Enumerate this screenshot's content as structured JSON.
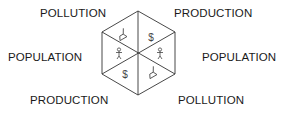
{
  "diagram": {
    "type": "hexagon-cycle",
    "labels": {
      "top_left": "POLLUTION",
      "top_right": "PRODUCTION",
      "left": "POPULATION",
      "right": "POPULATION",
      "bottom_left": "PRODUCTION",
      "bottom_right": "POLLUTION"
    },
    "segments": [
      {
        "position": "upper-left",
        "icon": "smokestack-icon"
      },
      {
        "position": "upper-right",
        "icon": "dollar-icon",
        "glyph": "$"
      },
      {
        "position": "left",
        "icon": "person-icon"
      },
      {
        "position": "right",
        "icon": "person-icon"
      },
      {
        "position": "lower-left",
        "icon": "dollar-icon",
        "glyph": "$"
      },
      {
        "position": "lower-right",
        "icon": "smokestack-icon"
      }
    ],
    "colors": {
      "stroke": "#333333",
      "text": "#1a1a1a"
    }
  }
}
